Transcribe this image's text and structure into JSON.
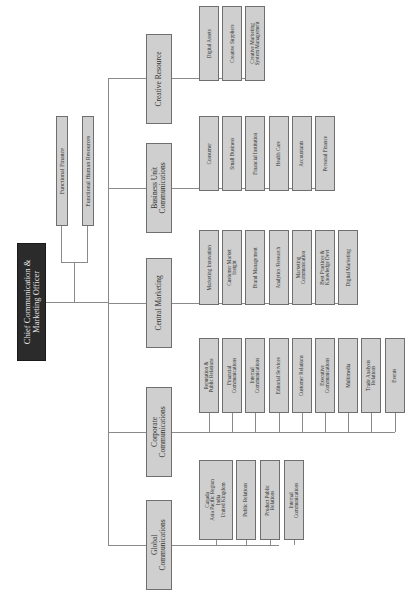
{
  "root": {
    "label": "Chief Communication &\nMarketing Officer"
  },
  "functional": [
    {
      "label": "Functional Finance"
    },
    {
      "label": "Functional Human Resources"
    }
  ],
  "divisions": [
    {
      "label": "Creative Resource",
      "children": [
        "Digital Assets",
        "Creative Suppliers",
        "Creative Marketing\nSystem Management"
      ]
    },
    {
      "label": "Business Unit\nCommunications",
      "children": [
        "Consumer",
        "Small Business",
        "Financial Institution",
        "Health Care",
        "Accountants",
        "Personal Finance"
      ]
    },
    {
      "label": "Central Marketing",
      "children": [
        "Marketing Innovation",
        "Customer Market\nInsight",
        "Brand Management",
        "Analytics /Research",
        "Marketing\nCommunication",
        "Best Practices &\nKnowledge Devt",
        "Digital Marketing"
      ]
    },
    {
      "label": "Corporate\nCommunications",
      "children": [
        "Reputation &\nPublic Relations",
        "Financial\nCommunications",
        "Internal\nCommunications",
        "Editorial Services",
        "Customer Relations",
        "Executive\nCommunications",
        "Multimedia",
        "Trade Analysis\nRelations",
        "Events"
      ]
    },
    {
      "label": "Global\nCommunications",
      "children": [
        "Canada\nAsia Pacific Region\nIndia\nUnited Kingdom",
        "Public Relations",
        "Product Public\nRelations",
        "Internal\nCommunications"
      ]
    }
  ]
}
